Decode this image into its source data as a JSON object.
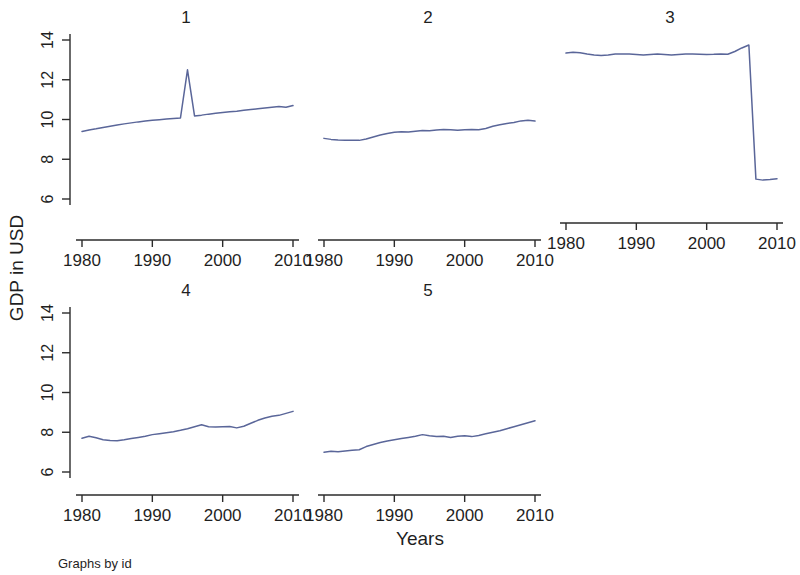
{
  "figure": {
    "ylabel": "GDP in USD",
    "xlabel": "Years",
    "footnote": "Graphs by id",
    "line_color": "#5a6699",
    "axis_color": "#2b2b2b",
    "background": "#ffffff"
  },
  "panels": [
    {
      "title": "1"
    },
    {
      "title": "2"
    },
    {
      "title": "3"
    },
    {
      "title": "4"
    },
    {
      "title": "5"
    }
  ],
  "ticks": {
    "y": [
      "6",
      "8",
      "10",
      "12",
      "14"
    ],
    "x": [
      "1980",
      "1990",
      "2000",
      "2010"
    ]
  },
  "chart_data": {
    "type": "line",
    "title": "",
    "subtitle": "",
    "xlabel": "Years",
    "ylabel": "GDP in USD",
    "footnote": "Graphs by id",
    "layout": "small-multiples (5 panels, 3 columns x 2 rows, panel 6 empty)",
    "legend": "none",
    "grid": false,
    "xlim": [
      1980,
      2010
    ],
    "ylim": [
      5.2,
      14.6
    ],
    "yticks": [
      6,
      8,
      10,
      12,
      14
    ],
    "xticks": [
      1980,
      1990,
      2000,
      2010
    ],
    "x": [
      1980,
      1981,
      1982,
      1983,
      1984,
      1985,
      1986,
      1987,
      1988,
      1989,
      1990,
      1991,
      1992,
      1993,
      1994,
      1995,
      1996,
      1997,
      1998,
      1999,
      2000,
      2001,
      2002,
      2003,
      2004,
      2005,
      2006,
      2007,
      2008,
      2009,
      2010
    ],
    "series": [
      {
        "name": "1",
        "panel": "1",
        "values": [
          9.4,
          9.47,
          9.53,
          9.6,
          9.66,
          9.72,
          9.78,
          9.83,
          9.88,
          9.92,
          9.96,
          9.99,
          10.02,
          10.05,
          10.08,
          12.5,
          10.18,
          10.22,
          10.27,
          10.31,
          10.35,
          10.39,
          10.42,
          10.46,
          10.5,
          10.54,
          10.58,
          10.62,
          10.66,
          10.62,
          10.7
        ]
      },
      {
        "name": "2",
        "panel": "2",
        "values": [
          9.05,
          9.0,
          8.97,
          8.96,
          8.95,
          8.95,
          9.02,
          9.12,
          9.22,
          9.3,
          9.36,
          9.38,
          9.37,
          9.41,
          9.45,
          9.44,
          9.47,
          9.5,
          9.48,
          9.46,
          9.48,
          9.5,
          9.48,
          9.55,
          9.66,
          9.74,
          9.8,
          9.85,
          9.93,
          9.96,
          9.92
        ]
      },
      {
        "name": "3",
        "panel": "3",
        "values": [
          13.34,
          13.38,
          13.36,
          13.3,
          13.25,
          13.22,
          13.25,
          13.3,
          13.3,
          13.29,
          13.27,
          13.24,
          13.27,
          13.29,
          13.27,
          13.25,
          13.27,
          13.29,
          13.29,
          13.28,
          13.27,
          13.28,
          13.3,
          13.28,
          13.42,
          13.6,
          13.75,
          7.0,
          6.95,
          6.98,
          7.02
        ]
      },
      {
        "name": "4",
        "panel": "4",
        "values": [
          7.7,
          7.8,
          7.72,
          7.62,
          7.58,
          7.57,
          7.62,
          7.68,
          7.74,
          7.8,
          7.88,
          7.93,
          7.98,
          8.03,
          8.1,
          8.18,
          8.28,
          8.38,
          8.28,
          8.27,
          8.28,
          8.29,
          8.22,
          8.3,
          8.45,
          8.6,
          8.72,
          8.8,
          8.85,
          8.95,
          9.05
        ]
      },
      {
        "name": "5",
        "panel": "5",
        "values": [
          7.0,
          7.04,
          7.02,
          7.06,
          7.1,
          7.12,
          7.28,
          7.38,
          7.48,
          7.56,
          7.62,
          7.68,
          7.74,
          7.8,
          7.88,
          7.82,
          7.78,
          7.8,
          7.74,
          7.8,
          7.82,
          7.78,
          7.84,
          7.92,
          8.0,
          8.08,
          8.18,
          8.28,
          8.38,
          8.48,
          8.58
        ]
      }
    ]
  }
}
